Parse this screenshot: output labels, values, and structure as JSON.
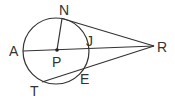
{
  "diagram": {
    "type": "geometry",
    "stroke_color": "#333333",
    "points": {
      "N": {
        "label": "N"
      },
      "A": {
        "label": "A"
      },
      "J": {
        "label": "J"
      },
      "P": {
        "label": "P"
      },
      "R": {
        "label": "R"
      },
      "E": {
        "label": "E"
      },
      "T": {
        "label": "T"
      }
    },
    "segments": [
      "NR",
      "AR",
      "TR",
      "PN"
    ],
    "circle": {
      "center": "P"
    }
  }
}
